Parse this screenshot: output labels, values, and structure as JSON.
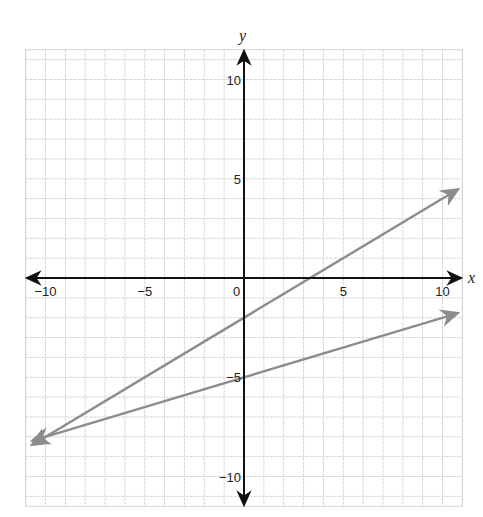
{
  "chart_data": {
    "type": "line",
    "title": "",
    "xlabel": "x",
    "ylabel": "y",
    "xlim": [
      -11,
      11
    ],
    "ylim": [
      -11.5,
      11.5
    ],
    "grid": true,
    "x_ticks": [
      -10,
      -5,
      0,
      5,
      10
    ],
    "x_tick_labels": [
      "−10",
      "−5",
      "0",
      "5",
      "10"
    ],
    "y_ticks": [
      10,
      5,
      -5,
      -10
    ],
    "y_tick_labels": [
      "10",
      "5",
      "−5",
      "−10"
    ],
    "series": [
      {
        "name": "line-1",
        "equation": "y = 0.6x - 2",
        "slope": 0.6,
        "intercept": -2,
        "x": [
          -10.8,
          10.9
        ],
        "y": [
          -8.5,
          4.5
        ],
        "arrows": "both",
        "color": "#8c8c8c"
      },
      {
        "name": "line-2",
        "equation": "y = 0.3x - 5",
        "slope": 0.3,
        "intercept": -5,
        "x": [
          -10.8,
          10.9
        ],
        "y": [
          -8.3,
          -1.8
        ],
        "arrows": "both",
        "color": "#8c8c8c"
      }
    ],
    "annotations": [
      {
        "text": "intersection",
        "x": -10,
        "y": -8
      }
    ]
  },
  "colors": {
    "axis": "#111111",
    "grid": "#d4d4d4",
    "line": "#8c8c8c"
  }
}
